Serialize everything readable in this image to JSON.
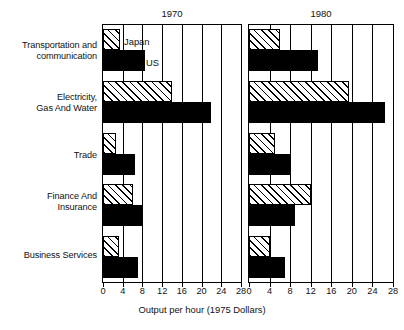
{
  "chart_data": {
    "type": "bar",
    "orientation": "horizontal",
    "title": "",
    "xlabel": "Output per hour (1975 Dollars)",
    "ylabel": "",
    "xlim": [
      0,
      28
    ],
    "xticks": [
      0,
      4,
      8,
      12,
      16,
      20,
      24,
      28
    ],
    "grid": true,
    "legend_position": "inline-top-left",
    "categories": [
      "Transportation and\ncommunication",
      "Electricity,\nGas And Water",
      "Trade",
      "Finance And\nInsurance",
      "Business Services"
    ],
    "panels": [
      {
        "title": "1970",
        "series": [
          {
            "name": "Japan",
            "style": "hatched",
            "values": [
              3.5,
              14.0,
              2.7,
              6.0,
              3.3
            ]
          },
          {
            "name": "US",
            "style": "solid",
            "values": [
              8.5,
              22.0,
              6.5,
              8.0,
              7.0
            ]
          }
        ]
      },
      {
        "title": "1980",
        "series": [
          {
            "name": "Japan",
            "style": "hatched",
            "values": [
              6.0,
              19.5,
              5.0,
              12.0,
              4.0
            ]
          },
          {
            "name": "US",
            "style": "solid",
            "values": [
              13.5,
              26.5,
              8.0,
              9.0,
              7.0
            ]
          }
        ]
      }
    ],
    "legend": [
      {
        "label": "Japan",
        "style": "hatched"
      },
      {
        "label": "US",
        "style": "solid"
      }
    ]
  },
  "panel_titles": {
    "left": "1970",
    "right": "1980"
  },
  "legend_labels": {
    "japan": "Japan",
    "us": "US"
  },
  "axis": {
    "title": "Output per hour (1975 Dollars)",
    "tick_0": "0",
    "tick_4": "4",
    "tick_8": "8",
    "tick_12": "12",
    "tick_16": "16",
    "tick_20": "20",
    "tick_24": "24",
    "tick_28": "28"
  },
  "categories": {
    "c0": "Transportation and\ncommunication",
    "c1": "Electricity,\nGas And Water",
    "c2": "Trade",
    "c3": "Finance And\nInsurance",
    "c4": "Business Services"
  }
}
